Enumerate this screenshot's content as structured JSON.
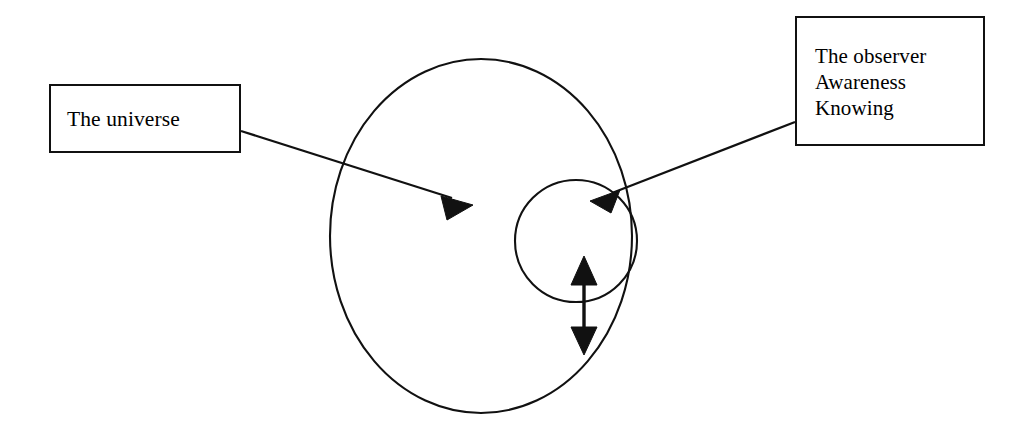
{
  "diagram": {
    "background_color": "#ffffff",
    "stroke_color": "#111111",
    "labels": {
      "universe": {
        "text": "The universe",
        "icon": "rectangle-label-box"
      },
      "observer": {
        "line1": "The observer",
        "line2": "Awareness",
        "line3": "Knowing",
        "icon": "rectangle-label-box"
      }
    },
    "shapes": {
      "outer_circle": {
        "name": "universe-circle",
        "center_x": 481,
        "center_y": 236,
        "radius_x": 151,
        "radius_y": 177
      },
      "inner_circle": {
        "name": "observer-circle",
        "center_x": 576,
        "center_y": 241,
        "radius_x": 61,
        "radius_y": 61
      }
    },
    "connectors": {
      "universe_arrow": {
        "name": "universe-pointer-arrow",
        "from_x": 241,
        "from_y": 131,
        "to_x": 473,
        "to_y": 205,
        "arrowheads": "end"
      },
      "observer_arrow": {
        "name": "observer-pointer-arrow",
        "from_x": 795,
        "from_y": 122,
        "to_x": 592,
        "to_y": 199,
        "arrowheads": "end"
      },
      "double_arrow": {
        "name": "bidirectional-vertical-arrow",
        "x": 584,
        "top_y": 258,
        "bottom_y": 353,
        "arrowheads": "both"
      }
    }
  }
}
